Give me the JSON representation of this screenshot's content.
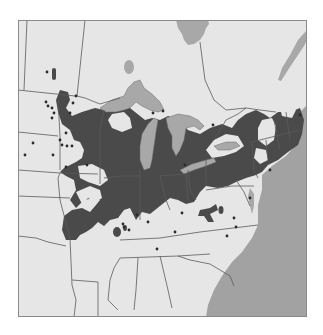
{
  "map": {
    "title": "",
    "region": "Eastern United States and Great Lakes",
    "colors": {
      "background": "#ffffff",
      "land": "#e6e6e6",
      "water": "#a2a2a2",
      "lakes": "#a8a8a8",
      "range": "#4a4a4a",
      "border": "#5a5a5a",
      "frame": "#8a8a8a",
      "points": "#2a2a2a"
    },
    "legend": [
      {
        "label": "Distribution range",
        "color": "#4a4a4a"
      },
      {
        "label": "Great Lakes / water",
        "color": "#a8a8a8"
      },
      {
        "label": "Occurrence record",
        "symbol": "dot"
      }
    ],
    "points": [
      [
        47,
        72
      ],
      [
        46,
        102
      ],
      [
        48,
        106
      ],
      [
        52,
        108
      ],
      [
        54,
        113
      ],
      [
        76,
        96
      ],
      [
        73,
        103
      ],
      [
        70,
        113
      ],
      [
        52,
        118
      ],
      [
        66,
        133
      ],
      [
        60,
        140
      ],
      [
        62,
        145
      ],
      [
        67,
        146
      ],
      [
        72,
        146
      ],
      [
        33,
        143
      ],
      [
        25,
        155
      ],
      [
        53,
        155
      ],
      [
        66,
        167
      ],
      [
        87,
        165
      ],
      [
        153,
        113
      ],
      [
        163,
        111
      ],
      [
        213,
        125
      ],
      [
        137,
        215
      ],
      [
        123,
        224
      ],
      [
        124,
        227
      ],
      [
        129,
        230
      ],
      [
        148,
        222
      ],
      [
        182,
        213
      ],
      [
        175,
        232
      ],
      [
        157,
        249
      ],
      [
        227,
        236
      ],
      [
        234,
        218
      ],
      [
        236,
        227
      ],
      [
        250,
        198
      ],
      [
        300,
        115
      ],
      [
        185,
        165
      ],
      [
        270,
        170
      ]
    ]
  }
}
